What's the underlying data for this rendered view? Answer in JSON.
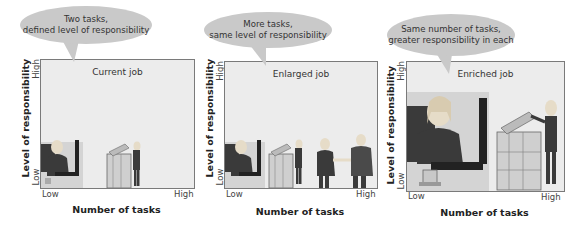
{
  "panels": [
    {
      "bubble": {
        "line1": "Two tasks,",
        "line2": "defined level of responsibility"
      },
      "title": "Current job",
      "y_axis": {
        "label": "Level of responsibility",
        "low": "Low",
        "high": "High"
      },
      "x_axis": {
        "label": "Number of tasks",
        "low": "Low",
        "high": "High"
      },
      "tasks": [
        "desk-worker",
        "copier-worker"
      ]
    },
    {
      "bubble": {
        "line1": "More tasks,",
        "line2": "same level of responsibility"
      },
      "title": "Enlarged job",
      "y_axis": {
        "label": "Level of responsibility",
        "low": "Low",
        "high": "High"
      },
      "x_axis": {
        "label": "Number of tasks",
        "low": "Low",
        "high": "High"
      },
      "tasks": [
        "desk-worker",
        "copier-worker",
        "handshake"
      ]
    },
    {
      "bubble": {
        "line1": "Same number of tasks,",
        "line2": "greater responsibility in each"
      },
      "title": "Enriched job",
      "y_axis": {
        "label": "Level of responsibility",
        "low": "Low",
        "high": "High"
      },
      "x_axis": {
        "label": "Number of tasks",
        "low": "Low",
        "high": "High"
      },
      "tasks": [
        "desk-worker-large",
        "copier-worker-large"
      ]
    }
  ],
  "colors": {
    "bubble": "#c9c9c9",
    "box_fill": "#ececec",
    "box_border": "#7a7a7a",
    "desk_bg": "#d4d4d4",
    "suit": "#3a3a3a"
  }
}
